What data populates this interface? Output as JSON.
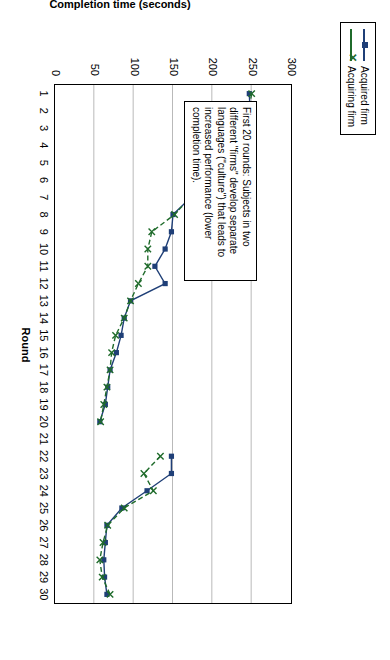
{
  "chart_data": {
    "type": "line",
    "title": "",
    "xlabel": "Round",
    "ylabel": "Completion time (seconds)",
    "ylim": [
      0,
      300
    ],
    "yticks": [
      0,
      50,
      100,
      150,
      200,
      250,
      300
    ],
    "xticks": [
      1,
      2,
      3,
      4,
      5,
      6,
      7,
      8,
      9,
      10,
      11,
      12,
      13,
      14,
      15,
      16,
      17,
      18,
      19,
      20,
      21,
      22,
      23,
      24,
      25,
      26,
      27,
      28,
      29,
      30
    ],
    "grid": true,
    "legend_position": "top",
    "x": [
      1,
      2,
      3,
      4,
      5,
      6,
      7,
      8,
      9,
      10,
      11,
      12,
      13,
      14,
      15,
      16,
      17,
      18,
      19,
      20,
      21,
      22,
      23,
      24,
      25,
      26,
      27,
      28,
      29,
      30
    ],
    "series": [
      {
        "name": "Acquired firm",
        "color": "#1f3f77",
        "marker": "square",
        "values": [
          247,
          248,
          227,
          205,
          196,
          176,
          173,
          150,
          148,
          140,
          127,
          140,
          96,
          88,
          84,
          78,
          70,
          67,
          64,
          57,
          null,
          148,
          148,
          117,
          85,
          66,
          64,
          62,
          63,
          66
        ]
      },
      {
        "name": "Acquiring firm",
        "color": "#1f6b2b",
        "marker": "x",
        "linestyle": "dashed",
        "values": [
          250,
          246,
          228,
          206,
          196,
          177,
          172,
          152,
          123,
          118,
          118,
          106,
          96,
          88,
          77,
          72,
          70,
          66,
          62,
          58,
          null,
          134,
          113,
          125,
          88,
          67,
          61,
          57,
          60,
          70
        ]
      }
    ],
    "annotation": "First 20 rounds: Subjects in two different \"firms\" develop separate languages (\"culture\") that leads to increased performance (lower completion time)."
  },
  "legend": {
    "items": [
      {
        "label": "Acquired firm"
      },
      {
        "label": "Acquiring firm"
      }
    ]
  }
}
